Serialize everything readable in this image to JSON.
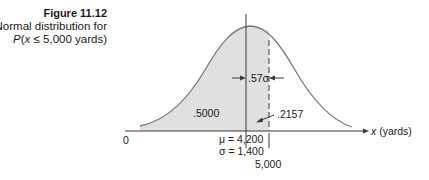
{
  "figure": {
    "number": "Figure 11.12",
    "description_line1": "Normal distribution for",
    "description_line2": "P(x ≤ 5,000 yards)"
  },
  "chart_data": {
    "type": "area",
    "title": "Normal distribution for P(x ≤ 5,000 yards)",
    "distribution": "normal",
    "mean": 4200,
    "std_dev": 1400,
    "x_value": 5000,
    "z_distance": ".57σ",
    "areas": [
      {
        "label": ".5000",
        "region": "x ≤ μ"
      },
      {
        "label": ".2157",
        "region": "μ ≤ x ≤ 5,000"
      }
    ],
    "xlabel": "x (yards)",
    "axis_labels": [
      "0",
      "μ = 4,200",
      "σ = 1,400",
      "5,000"
    ],
    "shaded_region": "x ≤ 5,000",
    "grid": false,
    "legend": "none"
  },
  "labels": {
    "origin": "0",
    "x_axis": "x (yards)",
    "mu": "μ = 4,200",
    "sigma": "σ = 1,400",
    "x_value": "5,000",
    "area_left": ".5000",
    "area_right": ".2157",
    "z_dist": ".57σ"
  },
  "colors": {
    "shade": "#e0e0e0",
    "curve": "#7a7a7a",
    "lines": "#3a3a3a"
  }
}
